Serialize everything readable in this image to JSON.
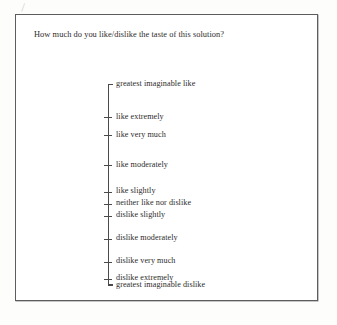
{
  "document": {
    "type": "questionnaire-card",
    "question": "How much do you like/dislike the taste of this solution?",
    "scan_artifact": "⁄"
  },
  "scale": {
    "orientation": "vertical",
    "name": "labeled-affective-magnitude-scale",
    "anchors": [
      {
        "label": "greatest imaginable like",
        "position_pct": 0.0,
        "endpoint": true
      },
      {
        "label": "like extremely",
        "position_pct": 16.5,
        "endpoint": false
      },
      {
        "label": "like very much",
        "position_pct": 25.5,
        "endpoint": false
      },
      {
        "label": "like moderately",
        "position_pct": 40.5,
        "endpoint": false
      },
      {
        "label": "like slightly",
        "position_pct": 53.5,
        "endpoint": false
      },
      {
        "label": "neither like nor dislike",
        "position_pct": 59.5,
        "endpoint": false
      },
      {
        "label": "dislike slightly",
        "position_pct": 65.5,
        "endpoint": false
      },
      {
        "label": "dislike moderately",
        "position_pct": 77.0,
        "endpoint": false
      },
      {
        "label": "dislike very much",
        "position_pct": 88.5,
        "endpoint": false
      },
      {
        "label": "dislike extremely",
        "position_pct": 97.0,
        "endpoint": false
      },
      {
        "label": "greatest imaginable dislike",
        "position_pct": 100.0,
        "endpoint": true
      }
    ]
  },
  "colors": {
    "ink": "#2e2c2b",
    "rule": "#4a4a4a",
    "border": "#5d5d5d",
    "paper": "#ffffff"
  }
}
